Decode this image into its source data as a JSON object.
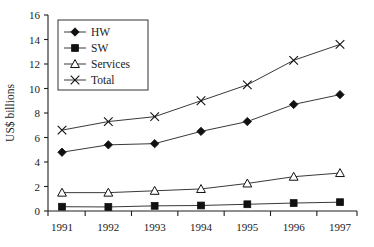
{
  "chart_data": {
    "type": "line",
    "title": "",
    "xlabel": "",
    "ylabel": "US$ billions",
    "categories": [
      "1991",
      "1992",
      "1993",
      "1994",
      "1995",
      "1996",
      "1997"
    ],
    "x": [
      1991,
      1992,
      1993,
      1994,
      1995,
      1996,
      1997
    ],
    "ylim": [
      0,
      16
    ],
    "yticks": [
      0,
      2,
      4,
      6,
      8,
      10,
      12,
      14,
      16
    ],
    "ytick_labels": [
      "0",
      "2",
      "4",
      "6",
      "8",
      "10",
      "12",
      "14",
      "16"
    ],
    "grid": false,
    "legend_position": "upper-left",
    "series": [
      {
        "name": "HW",
        "marker": "filled-diamond",
        "values": [
          4.8,
          5.4,
          5.5,
          6.5,
          7.3,
          8.7,
          9.5
        ]
      },
      {
        "name": "SW",
        "marker": "filled-square",
        "values": [
          0.35,
          0.33,
          0.42,
          0.45,
          0.55,
          0.65,
          0.72
        ]
      },
      {
        "name": "Services",
        "marker": "open-triangle",
        "values": [
          1.5,
          1.5,
          1.65,
          1.8,
          2.25,
          2.8,
          3.1
        ]
      },
      {
        "name": "Total",
        "marker": "cross",
        "values": [
          6.6,
          7.3,
          7.7,
          9.0,
          10.3,
          12.3,
          13.6
        ]
      }
    ]
  },
  "colors": {
    "axis": "#202020",
    "series": "#111111",
    "background": "#ffffff"
  }
}
